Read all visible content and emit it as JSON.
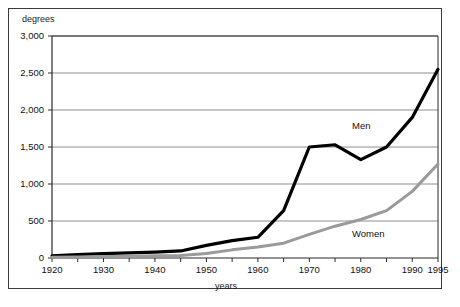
{
  "chart_data": {
    "type": "line",
    "title": "",
    "xlabel": "years",
    "ylabel": "degrees",
    "xlim": [
      1920,
      1995
    ],
    "ylim": [
      0,
      3000
    ],
    "grid": "horizontal",
    "legend_position": "inline-annotations",
    "x": [
      1920,
      1925,
      1930,
      1935,
      1940,
      1945,
      1950,
      1955,
      1960,
      1965,
      1970,
      1975,
      1980,
      1985,
      1990,
      1995
    ],
    "series": [
      {
        "name": "Men",
        "color": "#000000",
        "values": [
          30,
          45,
          60,
          70,
          80,
          95,
          170,
          235,
          280,
          640,
          1500,
          1530,
          1330,
          1500,
          1900,
          2550
        ]
      },
      {
        "name": "Women",
        "color": "#9a9a9a",
        "values": [
          10,
          14,
          20,
          25,
          30,
          35,
          60,
          110,
          150,
          200,
          320,
          430,
          520,
          640,
          900,
          1270
        ]
      }
    ],
    "ytick_labels": [
      "3,000",
      "2,500",
      "2,000",
      "1,500",
      "1,000",
      "500",
      "0"
    ],
    "ytick_values": [
      3000,
      2500,
      2000,
      1500,
      1000,
      500,
      0
    ],
    "xtick_labels": [
      "1920",
      "1930",
      "1940",
      "1950",
      "1960",
      "1970",
      "1980",
      "1990",
      "1995"
    ],
    "xtick_values": [
      1920,
      1930,
      1940,
      1950,
      1960,
      1970,
      1980,
      1990,
      1995
    ],
    "xtick_minor_values": [
      1925,
      1935,
      1945,
      1955,
      1965,
      1975,
      1985
    ]
  },
  "annotations": {
    "men_label": "Men",
    "women_label": "Women"
  },
  "axes": {
    "y_title": "degrees",
    "x_title": "years"
  },
  "colors": {
    "men_line": "#000000",
    "women_line": "#9a9a9a",
    "grid": "#8e8e8e",
    "axis": "#2b2b2b",
    "frame": "#3a3a3a",
    "background": "#ffffff"
  }
}
